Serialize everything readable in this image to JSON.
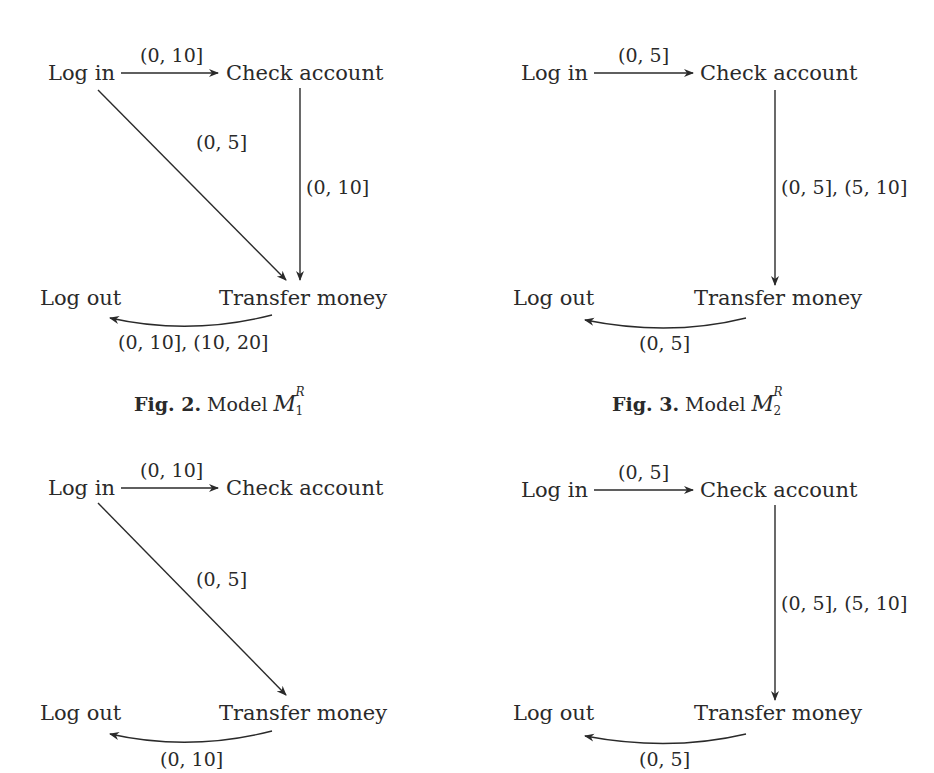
{
  "figures": [
    {
      "id": "fig2",
      "nodes": {
        "login": "Log in",
        "check": "Check account",
        "logout": "Log out",
        "transfer": "Transfer money"
      },
      "edges": {
        "login_check": "(0, 10]",
        "check_transfer": "(0, 10]",
        "login_transfer": "(0, 5]",
        "transfer_logout": "(0, 10], (10, 20]"
      },
      "caption": {
        "prefix": "Fig. 2.",
        "text": "Model",
        "symbol": "M",
        "sup": "R",
        "sub": "1"
      }
    },
    {
      "id": "fig3",
      "nodes": {
        "login": "Log in",
        "check": "Check account",
        "logout": "Log out",
        "transfer": "Transfer money"
      },
      "edges": {
        "login_check": "(0, 5]",
        "check_transfer": "(0, 5], (5, 10]",
        "transfer_logout": "(0, 5]"
      },
      "caption": {
        "prefix": "Fig. 3.",
        "text": "Model",
        "symbol": "M",
        "sup": "R",
        "sub": "2"
      }
    },
    {
      "id": "fig4",
      "nodes": {
        "login": "Log in",
        "check": "Check account",
        "logout": "Log out",
        "transfer": "Transfer money"
      },
      "edges": {
        "login_check": "(0, 10]",
        "login_transfer": "(0, 5]",
        "transfer_logout": "(0, 10]"
      }
    },
    {
      "id": "fig5",
      "nodes": {
        "login": "Log in",
        "check": "Check account",
        "logout": "Log out",
        "transfer": "Transfer money"
      },
      "edges": {
        "login_check": "(0, 5]",
        "check_transfer": "(0, 5], (5, 10]",
        "transfer_logout": "(0, 5]"
      }
    }
  ]
}
